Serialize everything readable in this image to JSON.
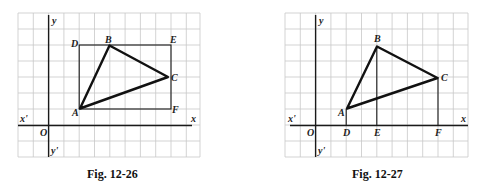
{
  "figures": [
    {
      "caption": "Fig. 12-26",
      "axis_labels": {
        "x": "x",
        "x_neg": "x'",
        "y": "y",
        "y_neg": "y'",
        "origin": "O"
      },
      "points": {
        "A": "A",
        "B": "B",
        "C": "C",
        "D": "D",
        "E": "E",
        "F": "F"
      },
      "description": "Triangle ABC inscribed in rectangle ADEF (D top-left, E top-right, F bottom-right)"
    },
    {
      "caption": "Fig. 12-27",
      "axis_labels": {
        "x": "x",
        "x_neg": "x'",
        "y": "y",
        "y_neg": "y'",
        "origin": "O"
      },
      "points": {
        "A": "A",
        "B": "B",
        "C": "C",
        "D": "D",
        "E": "E",
        "F": "F"
      },
      "description": "Triangle ABC with perpendiculars AD, BE, CF dropped to the x-axis"
    }
  ],
  "colors": {
    "grid": "#c8c8c8",
    "lines": "#111111"
  }
}
